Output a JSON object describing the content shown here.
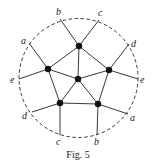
{
  "figure": {
    "caption": "Fig. 5",
    "boundary_circle": {
      "cx": 78.5,
      "cy": 78,
      "r": 59.5,
      "style": "dashed"
    },
    "nodes": [
      {
        "id": "center",
        "x": 78,
        "y": 79
      },
      {
        "id": "top",
        "x": 79,
        "y": 46
      },
      {
        "id": "left",
        "x": 48,
        "y": 69
      },
      {
        "id": "right",
        "x": 109,
        "y": 70
      },
      {
        "id": "bottom-left",
        "x": 60,
        "y": 103
      },
      {
        "id": "bottom-right",
        "x": 98,
        "y": 104
      }
    ],
    "endpoints": [
      {
        "label": "b",
        "x": 60,
        "y": 19,
        "lx": 56,
        "ly": 15
      },
      {
        "label": "c",
        "x": 99,
        "y": 20,
        "lx": 98,
        "ly": 16
      },
      {
        "label": "a",
        "x": 29,
        "y": 43,
        "lx": 21,
        "ly": 44
      },
      {
        "label": "d",
        "x": 129,
        "y": 44,
        "lx": 131,
        "ly": 47
      },
      {
        "label": "e",
        "x": 19,
        "y": 79,
        "lx": 10,
        "ly": 83
      },
      {
        "label": "e",
        "x": 138,
        "y": 79,
        "lx": 140,
        "ly": 83
      },
      {
        "label": "d",
        "x": 32,
        "y": 112,
        "lx": 22,
        "ly": 119
      },
      {
        "label": "a",
        "x": 128,
        "y": 114,
        "lx": 130,
        "ly": 121
      },
      {
        "label": "c",
        "x": 60,
        "y": 135,
        "lx": 56,
        "ly": 145
      },
      {
        "label": "b",
        "x": 97,
        "y": 135,
        "lx": 94,
        "ly": 145
      }
    ],
    "edges": [
      [
        "center",
        "top"
      ],
      [
        "center",
        "left"
      ],
      [
        "center",
        "right"
      ],
      [
        "center",
        "bottom-left"
      ],
      [
        "center",
        "bottom-right"
      ],
      [
        "top",
        "left"
      ],
      [
        "top",
        "right"
      ],
      [
        "left",
        "bottom-left"
      ],
      [
        "right",
        "bottom-right"
      ],
      [
        "bottom-left",
        "bottom-right"
      ]
    ],
    "pendant_edges": [
      [
        "top",
        0
      ],
      [
        "top",
        1
      ],
      [
        "left",
        2
      ],
      [
        "right",
        3
      ],
      [
        "left",
        4
      ],
      [
        "right",
        5
      ],
      [
        "bottom-left",
        6
      ],
      [
        "bottom-right",
        7
      ],
      [
        "bottom-left",
        8
      ],
      [
        "bottom-right",
        9
      ]
    ]
  }
}
